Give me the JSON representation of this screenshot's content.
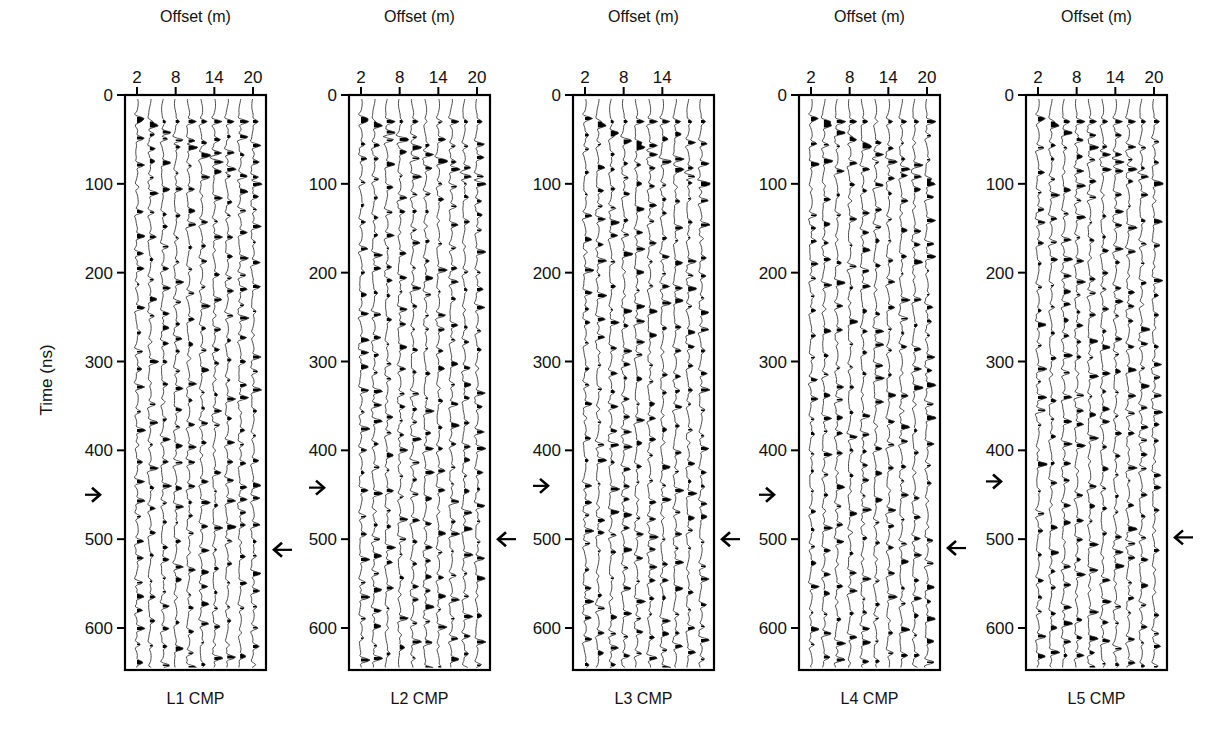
{
  "chart_data": {
    "type": "wiggle-trace",
    "figure_description": "Five GPR common-midpoint (CMP) gathers displayed as variable-area wiggle traces",
    "ylabel": "Time (ns)",
    "xlabel": "Offset (m)",
    "ylim": [
      0,
      650
    ],
    "y_ticks": [
      0,
      100,
      200,
      300,
      400,
      500,
      600
    ],
    "y_invert": true,
    "grid": false,
    "panels": [
      {
        "name": "L1 CMP",
        "xlabel": "Offset (m)",
        "x_ticks": [
          2,
          8,
          14,
          20
        ],
        "traces": 10,
        "arrow_left_ns": 450,
        "arrow_right_ns": 512
      },
      {
        "name": "L2 CMP",
        "xlabel": "Offset (m)",
        "x_ticks": [
          2,
          8,
          14,
          20
        ],
        "traces": 10,
        "arrow_left_ns": 442,
        "arrow_right_ns": 500
      },
      {
        "name": "L3 CMP",
        "xlabel": "Offset (m)",
        "x_ticks": [
          2,
          8,
          14
        ],
        "traces": 10,
        "arrow_left_ns": 440,
        "arrow_right_ns": 500
      },
      {
        "name": "L4 CMP",
        "xlabel": "Offset (m)",
        "x_ticks": [
          2,
          8,
          14,
          20
        ],
        "traces": 10,
        "arrow_left_ns": 450,
        "arrow_right_ns": 510
      },
      {
        "name": "L5 CMP",
        "xlabel": "Offset (m)",
        "x_ticks": [
          2,
          8,
          14,
          20
        ],
        "traces": 10,
        "arrow_left_ns": 435,
        "arrow_right_ns": 498
      }
    ]
  },
  "labels": {
    "ylabel": "Time (ns)",
    "xlabel": "Offset (m)",
    "panel_titles": [
      "L1 CMP",
      "L2 CMP",
      "L3 CMP",
      "L4 CMP",
      "L5 CMP"
    ]
  }
}
